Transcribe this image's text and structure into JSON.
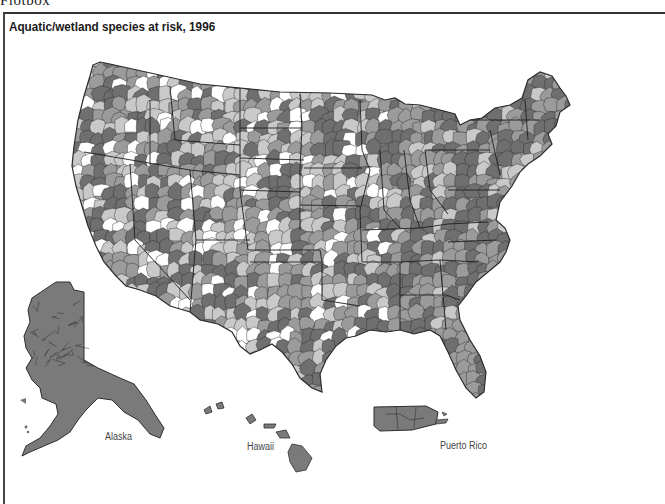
{
  "header": {
    "cut_text": "Flotbox"
  },
  "map": {
    "title": "Aquatic/wetland species at risk, 1996",
    "unit": "watersheds",
    "shades": [
      "#ffffff",
      "#c9c9c9",
      "#9b9b9b",
      "#6f6f6f"
    ],
    "border_color": "#2e2e2e",
    "labels": {
      "alaska": "Alaska",
      "hawaii": "Hawaii",
      "puerto_rico": "Puerto Rico"
    }
  }
}
